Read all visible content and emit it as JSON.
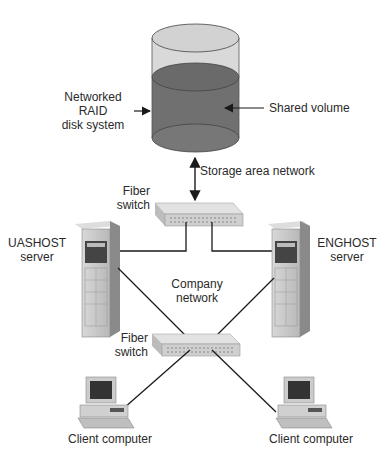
{
  "diagram": {
    "type": "network-storage-topology",
    "nodes": {
      "raid": {
        "label_line1": "Networked",
        "label_line2": "RAID",
        "label_line3": "disk system",
        "volume_label": "Shared volume"
      },
      "san": {
        "label": "Storage area network"
      },
      "fiber_switch_top": {
        "label_line1": "Fiber",
        "label_line2": "switch"
      },
      "uashost": {
        "label_line1": "UASHOST",
        "label_line2": "server"
      },
      "enghost": {
        "label_line1": "ENGHOST",
        "label_line2": "server"
      },
      "company_network": {
        "label_line1": "Company",
        "label_line2": "network"
      },
      "fiber_switch_bottom": {
        "label_line1": "Fiber",
        "label_line2": "switch"
      },
      "client_left": {
        "label": "Client computer"
      },
      "client_right": {
        "label": "Client computer"
      }
    },
    "edges": [
      {
        "from": "raid",
        "to": "fiber_switch_top",
        "style": "double-arrow"
      },
      {
        "from": "fiber_switch_top",
        "to": "uashost",
        "style": "line"
      },
      {
        "from": "fiber_switch_top",
        "to": "enghost",
        "style": "line"
      },
      {
        "from": "uashost",
        "to": "fiber_switch_bottom",
        "style": "line"
      },
      {
        "from": "enghost",
        "to": "fiber_switch_bottom",
        "style": "line"
      },
      {
        "from": "fiber_switch_bottom",
        "to": "client_left",
        "style": "line"
      },
      {
        "from": "fiber_switch_bottom",
        "to": "client_right",
        "style": "line"
      }
    ],
    "colors": {
      "cylinder_light": "#d6d6d6",
      "cylinder_dark": "#6e6e6e",
      "line": "#1a1a1a",
      "device": "#c9c9c9"
    }
  }
}
